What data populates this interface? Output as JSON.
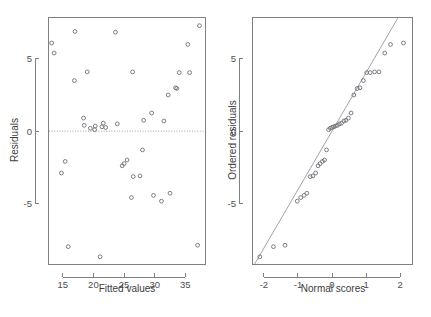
{
  "figure": {
    "background": "#ffffff",
    "marker_color": "#6e6e78",
    "axis_color": "#808080",
    "text_color": "#3d3d3d"
  },
  "chart_data": [
    {
      "type": "scatter",
      "panel": "left",
      "title": "",
      "xlabel": "Fitted values",
      "ylabel": "Residuals",
      "xlim": [
        12.6,
        38.2
      ],
      "ylim": [
        -9.2,
        7.9
      ],
      "xticks": [
        15,
        20,
        25,
        30,
        35
      ],
      "xticklabels": [
        "15",
        "20",
        "25",
        "30",
        "35"
      ],
      "yticks": [
        5,
        0,
        -5
      ],
      "yticklabels": [
        "5",
        "0",
        "-5"
      ],
      "grid": false,
      "legend": null,
      "reference_line": {
        "kind": "horizontal",
        "y": 0,
        "style": "dotted"
      },
      "x": [
        13.2,
        13.6,
        14.8,
        15.4,
        15.9,
        16.9,
        17.0,
        18.4,
        18.5,
        19.0,
        19.5,
        20.2,
        20.3,
        21.1,
        21.4,
        21.6,
        22.0,
        23.6,
        23.9,
        24.7,
        25.0,
        25.5,
        26.2,
        26.4,
        26.5,
        27.6,
        28.0,
        28.2,
        29.5,
        29.8,
        31.1,
        31.5,
        32.2,
        32.5,
        33.4,
        33.6,
        34.0,
        35.4,
        35.7,
        37.0,
        37.3
      ],
      "y": [
        6.1,
        5.4,
        -2.9,
        -2.1,
        -8.0,
        3.5,
        6.9,
        0.9,
        0.4,
        4.1,
        0.2,
        0.1,
        0.35,
        -8.7,
        0.3,
        0.55,
        0.25,
        6.85,
        0.5,
        -2.4,
        -2.25,
        -2.0,
        -4.6,
        4.1,
        -3.15,
        -3.1,
        -1.3,
        0.75,
        1.25,
        -4.45,
        -4.85,
        0.7,
        2.5,
        -4.3,
        3.0,
        2.95,
        4.05,
        6.0,
        4.05,
        -7.9,
        7.3
      ]
    },
    {
      "type": "scatter",
      "panel": "right",
      "title": "",
      "xlabel": "Normal scores",
      "ylabel": "Ordered residuals",
      "xlim": [
        -2.35,
        2.35
      ],
      "ylim": [
        -9.2,
        7.9
      ],
      "xticks": [
        -2,
        -1,
        0,
        1,
        2
      ],
      "xticklabels": [
        "-2",
        "-1",
        "0",
        "1",
        "2"
      ],
      "yticks": [
        5,
        0,
        -5
      ],
      "yticklabels": [
        "5",
        "0",
        "-5"
      ],
      "grid": false,
      "legend": null,
      "reference_line": {
        "kind": "qq",
        "slope": 4.05,
        "intercept": 0.0,
        "style": "solid"
      },
      "x": [
        -2.12,
        -1.72,
        -1.38,
        -1.02,
        -0.92,
        -0.82,
        -0.74,
        -0.64,
        -0.56,
        -0.48,
        -0.41,
        -0.35,
        -0.28,
        -0.22,
        -0.16,
        -0.1,
        -0.05,
        0.0,
        0.05,
        0.1,
        0.16,
        0.22,
        0.28,
        0.35,
        0.41,
        0.48,
        0.56,
        0.64,
        0.74,
        0.82,
        0.92,
        1.02,
        1.12,
        1.25,
        1.38,
        1.55,
        1.72,
        2.1
      ],
      "y": [
        -8.7,
        -8.0,
        -7.9,
        -4.85,
        -4.6,
        -4.45,
        -4.3,
        -3.15,
        -3.1,
        -2.9,
        -2.4,
        -2.25,
        -2.1,
        -2.0,
        -1.3,
        0.1,
        0.2,
        0.25,
        0.3,
        0.35,
        0.4,
        0.5,
        0.55,
        0.7,
        0.75,
        0.9,
        1.25,
        2.5,
        2.95,
        3.0,
        3.5,
        4.05,
        4.05,
        4.1,
        4.1,
        5.4,
        6.0,
        6.1,
        6.85,
        6.9,
        7.3
      ]
    }
  ]
}
